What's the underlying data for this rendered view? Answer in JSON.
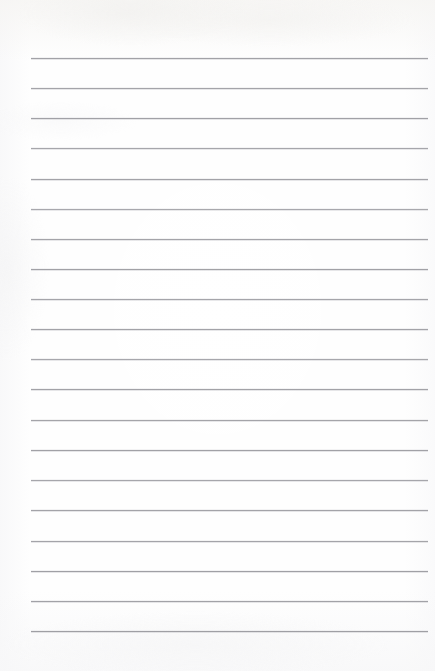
{
  "document": {
    "type": "ruled-notebook-paper",
    "title": "Blank Ruled Paper",
    "page_width": 435,
    "page_height": 671,
    "background_color": "#fefefe",
    "content_text": "",
    "handwriting_present": "no",
    "margin_rule_present": "no",
    "hole_punches_present": "no"
  },
  "rules": {
    "count": 20,
    "line_color": "#9b9ba0",
    "line_thickness_px": 1,
    "left_x_px": 31,
    "right_x_px": 428,
    "first_line_y_px": 58,
    "last_line_y_px": 631,
    "spacing_px": 30.2,
    "lines": [
      {
        "index": 1,
        "y": 58,
        "left": 31,
        "right": 428,
        "opacity": 0.92
      },
      {
        "index": 2,
        "y": 88,
        "left": 31,
        "right": 428,
        "opacity": 0.9
      },
      {
        "index": 3,
        "y": 118,
        "left": 31,
        "right": 428,
        "opacity": 0.93
      },
      {
        "index": 4,
        "y": 148,
        "left": 31,
        "right": 428,
        "opacity": 0.88
      },
      {
        "index": 5,
        "y": 179,
        "left": 31,
        "right": 428,
        "opacity": 0.91
      },
      {
        "index": 6,
        "y": 209,
        "left": 31,
        "right": 428,
        "opacity": 0.86
      },
      {
        "index": 7,
        "y": 239,
        "left": 31,
        "right": 428,
        "opacity": 0.9
      },
      {
        "index": 8,
        "y": 269,
        "left": 31,
        "right": 428,
        "opacity": 0.93
      },
      {
        "index": 9,
        "y": 299,
        "left": 31,
        "right": 428,
        "opacity": 0.89
      },
      {
        "index": 10,
        "y": 329,
        "left": 31,
        "right": 428,
        "opacity": 0.91
      },
      {
        "index": 11,
        "y": 359,
        "left": 31,
        "right": 428,
        "opacity": 0.87
      },
      {
        "index": 12,
        "y": 389,
        "left": 31,
        "right": 428,
        "opacity": 0.92
      },
      {
        "index": 13,
        "y": 420,
        "left": 31,
        "right": 428,
        "opacity": 0.9
      },
      {
        "index": 14,
        "y": 450,
        "left": 31,
        "right": 428,
        "opacity": 0.93
      },
      {
        "index": 15,
        "y": 480,
        "left": 31,
        "right": 428,
        "opacity": 0.88
      },
      {
        "index": 16,
        "y": 510,
        "left": 31,
        "right": 428,
        "opacity": 0.91
      },
      {
        "index": 17,
        "y": 541,
        "left": 31,
        "right": 428,
        "opacity": 0.9
      },
      {
        "index": 18,
        "y": 571,
        "left": 31,
        "right": 428,
        "opacity": 0.94
      },
      {
        "index": 19,
        "y": 601,
        "left": 31,
        "right": 428,
        "opacity": 0.92
      },
      {
        "index": 20,
        "y": 631,
        "left": 31,
        "right": 428,
        "opacity": 0.95
      }
    ]
  }
}
